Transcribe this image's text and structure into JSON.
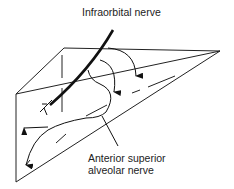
{
  "diagram": {
    "labels": {
      "infraorbital": "Infraorbital nerve",
      "asa_line1": "Anterior superior",
      "asa_line2": "alveolar nerve"
    },
    "colors": {
      "line": "#222222",
      "nerve": "#111111",
      "background": "#ffffff"
    }
  }
}
